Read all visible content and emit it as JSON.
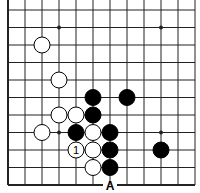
{
  "diagram": {
    "type": "go-board-fragment",
    "columns": 12,
    "rows": 11,
    "edges": {
      "left": true,
      "bottom": true,
      "top": false,
      "right": false
    },
    "grid": {
      "x0": 8,
      "y0": 10,
      "dx": 17,
      "dy": 17.5
    },
    "colors": {
      "line": "#222222",
      "black_stone": "#000000",
      "white_stone": "#ffffff",
      "background": "#ffffff"
    },
    "star_points": [
      {
        "col": 3,
        "row": 1
      },
      {
        "col": 9,
        "row": 1
      },
      {
        "col": 3,
        "row": 7
      },
      {
        "col": 9,
        "row": 7
      }
    ],
    "stones": [
      {
        "color": "white",
        "col": 2,
        "row": 2
      },
      {
        "color": "white",
        "col": 3,
        "row": 4
      },
      {
        "color": "black",
        "col": 5,
        "row": 5
      },
      {
        "color": "black",
        "col": 7,
        "row": 5
      },
      {
        "color": "white",
        "col": 3,
        "row": 6
      },
      {
        "color": "white",
        "col": 4,
        "row": 6
      },
      {
        "color": "black",
        "col": 5,
        "row": 6
      },
      {
        "color": "white",
        "col": 2,
        "row": 7
      },
      {
        "color": "black",
        "col": 4,
        "row": 7
      },
      {
        "color": "white",
        "col": 5,
        "row": 7
      },
      {
        "color": "black",
        "col": 6,
        "row": 7
      },
      {
        "color": "white",
        "col": 4,
        "row": 8,
        "label": "1"
      },
      {
        "color": "white",
        "col": 5,
        "row": 8
      },
      {
        "color": "black",
        "col": 6,
        "row": 8
      },
      {
        "color": "black",
        "col": 9,
        "row": 8
      },
      {
        "color": "white",
        "col": 5,
        "row": 9
      },
      {
        "color": "black",
        "col": 6,
        "row": 9
      }
    ],
    "point_labels": [
      {
        "text": "A",
        "col": 6,
        "row": 10
      }
    ]
  }
}
